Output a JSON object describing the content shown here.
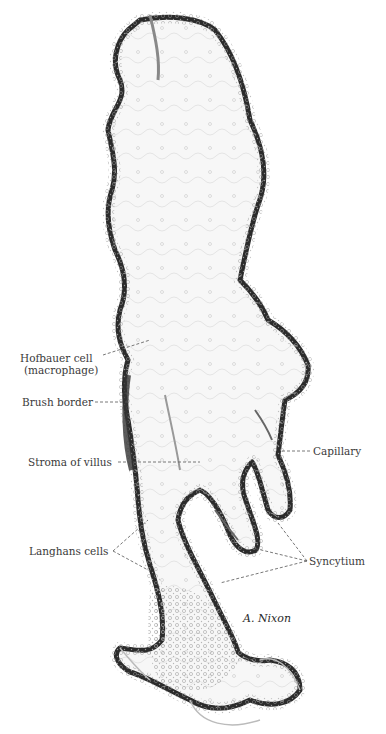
{
  "figure": {
    "signature": "A. Nixon",
    "colors": {
      "background": "#ffffff",
      "epithelium": "#2b2b2b",
      "stroma": "#f6f6f6",
      "cells": "#8a8a8a",
      "leader": "#555555",
      "label_text": "#3a3a3a"
    }
  },
  "labels": {
    "hofbauer": {
      "line1": "Hofbauer cell",
      "line2": "(macrophage)"
    },
    "brush_border": "Brush border",
    "stroma": "Stroma of villus",
    "capillary": "Capillary",
    "langhans": "Langhans cells",
    "syncytium": "Syncytium"
  }
}
